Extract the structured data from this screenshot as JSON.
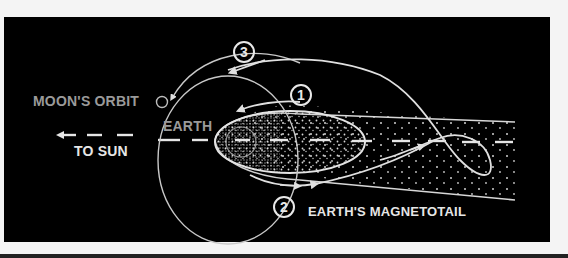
{
  "diagram": {
    "labels": {
      "moons_orbit": "MOON'S ORBIT",
      "earth": "EARTH",
      "to_sun": "TO SUN",
      "magnetotail": "EARTH'S MAGNETOTAIL"
    },
    "markers": [
      {
        "id": "1",
        "label": "1"
      },
      {
        "id": "2",
        "label": "2"
      },
      {
        "id": "3",
        "label": "3"
      }
    ],
    "colors": {
      "background": "#000000",
      "line": "#e0e0e0",
      "label_gray": "#9a9a9a",
      "label_white": "#e6e6e6",
      "page": "#f4f4f4"
    }
  }
}
